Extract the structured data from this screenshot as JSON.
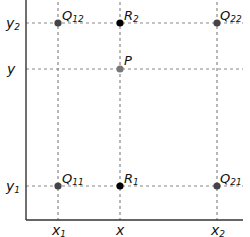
{
  "diagram": {
    "axis_labels": {
      "x": [
        "x1",
        "x",
        "x2"
      ],
      "y": [
        "y2",
        "y",
        "y1"
      ]
    },
    "x_ticks": [
      {
        "base": "x",
        "sub": "1"
      },
      {
        "base": "x",
        "sub": ""
      },
      {
        "base": "x",
        "sub": "2"
      }
    ],
    "y_ticks": [
      {
        "base": "y",
        "sub": "2"
      },
      {
        "base": "y",
        "sub": ""
      },
      {
        "base": "y",
        "sub": "1"
      }
    ],
    "points": [
      {
        "id": "Q12",
        "base": "Q",
        "sub": "12",
        "color": "#444444"
      },
      {
        "id": "R2",
        "base": "R",
        "sub": "2",
        "color": "#000000"
      },
      {
        "id": "Q22",
        "base": "Q",
        "sub": "22",
        "color": "#444444"
      },
      {
        "id": "P",
        "base": "P",
        "sub": "",
        "color": "#777777"
      },
      {
        "id": "Q11",
        "base": "Q",
        "sub": "11",
        "color": "#444444"
      },
      {
        "id": "R1",
        "base": "R",
        "sub": "1",
        "color": "#000000"
      },
      {
        "id": "Q21",
        "base": "Q",
        "sub": "21",
        "color": "#444444"
      }
    ],
    "colors": {
      "axis": "#333333",
      "grid": "#888888"
    }
  }
}
